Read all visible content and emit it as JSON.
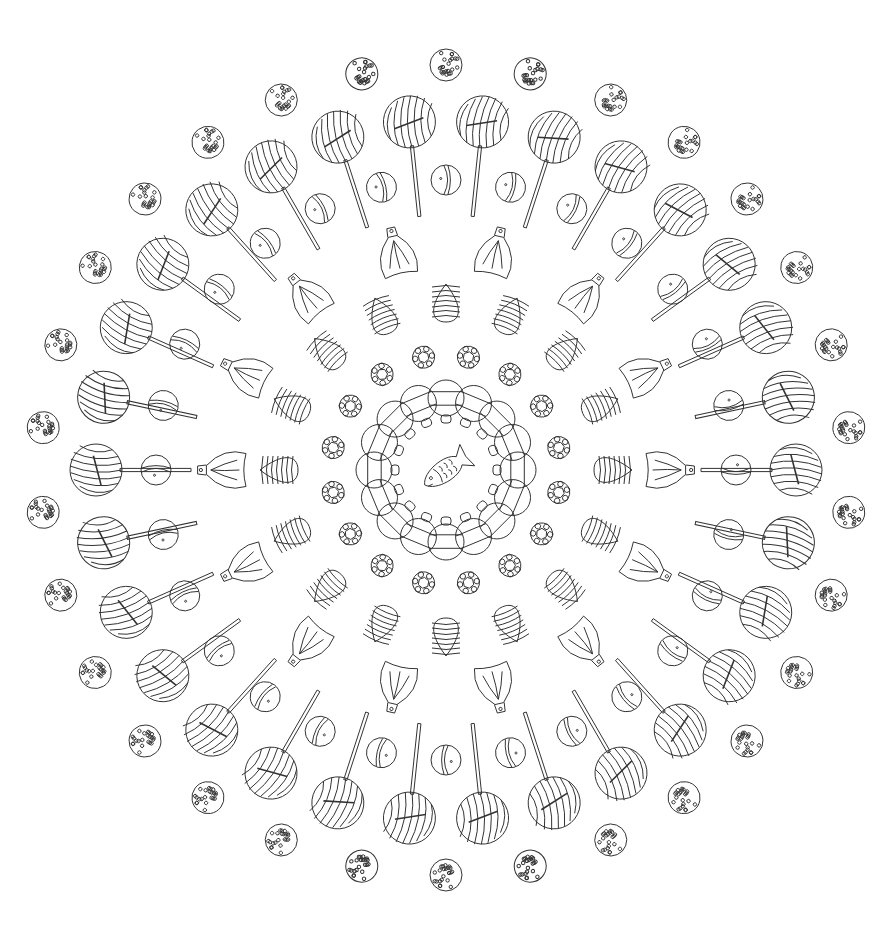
{
  "artwork": {
    "type": "mandala coloring page",
    "subject": "candies",
    "line_color": "#333333",
    "background": "#ffffff",
    "center": {
      "x": 446,
      "y": 470,
      "motif": "fish-candy"
    }
  },
  "rings": [
    {
      "name": "striped-bell-candies",
      "count": 16,
      "radius": 72,
      "size": 18
    },
    {
      "name": "flower-gems",
      "count": 16,
      "radius": 115,
      "size": 11
    },
    {
      "name": "striped-eggs",
      "count": 16,
      "radius": 168,
      "size": 20
    },
    {
      "name": "wrapped-candies",
      "count": 14,
      "radius": 222,
      "size": 22
    },
    {
      "name": "small-balls",
      "count": 28,
      "radius": 290,
      "size": 15
    },
    {
      "name": "lollipops",
      "count": 30,
      "radius": 350,
      "size": 26,
      "stick_inner": 255
    },
    {
      "name": "sprinkle-balls",
      "count": 30,
      "radius": 405,
      "size": 16
    }
  ]
}
